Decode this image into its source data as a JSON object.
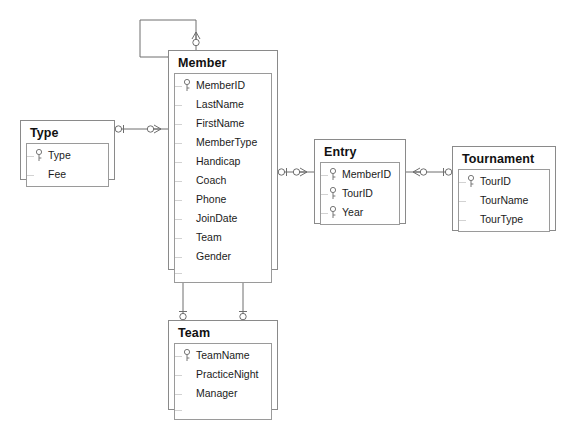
{
  "diagram": {
    "background_color": "#ffffff",
    "border_color": "#8a8a8a",
    "text_color": "#1b1b1b",
    "notation": "crow's foot",
    "key_icon": "key-icon"
  },
  "entities": [
    {
      "id": "type",
      "name": "Type",
      "x": 20,
      "y": 120,
      "width": 95,
      "height": 60,
      "fields": [
        {
          "name": "Type",
          "key": true
        },
        {
          "name": "Fee",
          "key": false
        }
      ]
    },
    {
      "id": "member",
      "name": "Member",
      "x": 168,
      "y": 50,
      "width": 110,
      "height": 220,
      "fields": [
        {
          "name": "MemberID",
          "key": true
        },
        {
          "name": "LastName",
          "key": false
        },
        {
          "name": "FirstName",
          "key": false
        },
        {
          "name": "MemberType",
          "key": false
        },
        {
          "name": "Handicap",
          "key": false
        },
        {
          "name": "Coach",
          "key": false
        },
        {
          "name": "Phone",
          "key": false
        },
        {
          "name": "JoinDate",
          "key": false
        },
        {
          "name": "Team",
          "key": false
        },
        {
          "name": "Gender",
          "key": false
        }
      ]
    },
    {
      "id": "entry",
      "name": "Entry",
      "x": 314,
      "y": 139,
      "width": 92,
      "height": 85,
      "fields": [
        {
          "name": "MemberID",
          "key": true
        },
        {
          "name": "TourID",
          "key": true
        },
        {
          "name": "Year",
          "key": true
        }
      ]
    },
    {
      "id": "tournament",
      "name": "Tournament",
      "x": 452,
      "y": 146,
      "width": 104,
      "height": 85,
      "fields": [
        {
          "name": "TourID",
          "key": true
        },
        {
          "name": "TourName",
          "key": false
        },
        {
          "name": "TourType",
          "key": false
        }
      ]
    },
    {
      "id": "team",
      "name": "Team",
      "x": 168,
      "y": 320,
      "width": 110,
      "height": 90,
      "fields": [
        {
          "name": "TeamName",
          "key": true
        },
        {
          "name": "PracticeNight",
          "key": false
        },
        {
          "name": "Manager",
          "key": false
        }
      ]
    }
  ],
  "relationships": [
    {
      "id": "member-self",
      "from": "member",
      "to": "member",
      "from_cardinality": "one",
      "to_cardinality": "many",
      "label": "member-self-reference"
    },
    {
      "id": "type-member",
      "from": "type",
      "to": "member",
      "from_cardinality": "one",
      "to_cardinality": "many",
      "label": "type-to-member"
    },
    {
      "id": "member-entry",
      "from": "member",
      "to": "entry",
      "from_cardinality": "one",
      "to_cardinality": "many",
      "label": "member-to-entry"
    },
    {
      "id": "tournament-entry",
      "from": "tournament",
      "to": "entry",
      "from_cardinality": "one",
      "to_cardinality": "many",
      "label": "tournament-to-entry"
    },
    {
      "id": "team-member-left",
      "from": "team",
      "to": "member",
      "from_cardinality": "one",
      "to_cardinality": "many",
      "label": "team-to-member-left"
    },
    {
      "id": "team-member-right",
      "from": "team",
      "to": "member",
      "from_cardinality": "one",
      "to_cardinality": "many",
      "label": "team-to-member-right"
    }
  ]
}
